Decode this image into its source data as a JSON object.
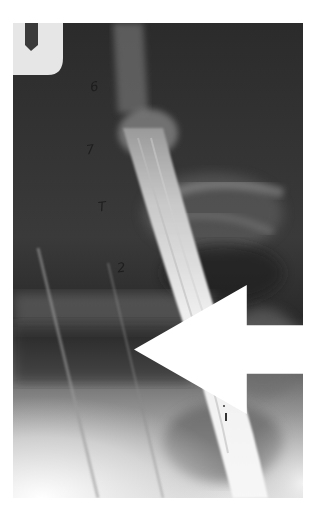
{
  "image": {
    "type": "radiograph",
    "description": "Lateral barium esophagram",
    "background_color": "#ffffff",
    "film_color_dark": "#262626",
    "contrast_color": "#f2f2f2"
  },
  "annotations": {
    "labels": [
      {
        "text": "6",
        "x": 90,
        "y": 80
      },
      {
        "text": "7",
        "x": 86,
        "y": 143
      },
      {
        "text": "T",
        "x": 98,
        "y": 200
      },
      {
        "text": "2",
        "x": 117,
        "y": 261
      }
    ],
    "arrows": [
      {
        "name": "upper-arrow",
        "color": "#ffffff",
        "direction": "left",
        "x": 134,
        "y": 112
      },
      {
        "name": "lower-arrow",
        "color": "#111111",
        "direction": "left",
        "x": 222,
        "y": 368
      }
    ]
  }
}
